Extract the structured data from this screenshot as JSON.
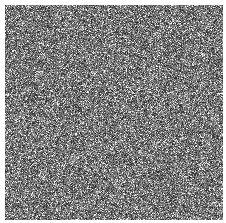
{
  "image": {
    "description": "Grayscale random pixel noise texture on white background",
    "background_color": "#ffffff",
    "texture": {
      "type": "random-grayscale-noise",
      "offset_x": 5,
      "offset_y": 5,
      "width": 218,
      "height": 215,
      "mean_gray": "#777777",
      "seed": 12345
    }
  }
}
